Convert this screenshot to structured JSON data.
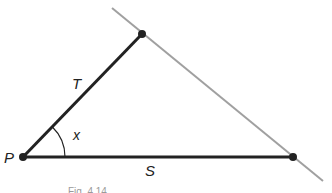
{
  "figure": {
    "caption": "Fig. 4.14",
    "vertices": {
      "P": {
        "x": 23,
        "y": 157
      },
      "top": {
        "x": 142,
        "y": 34
      },
      "right": {
        "x": 293,
        "y": 157
      }
    },
    "segments": {
      "T": {
        "label": "T",
        "from": "P",
        "to": "top",
        "color": "#222222"
      },
      "S": {
        "label": "S",
        "from": "P",
        "to": "right",
        "color": "#222222"
      },
      "extended_line": {
        "from": {
          "x": 112,
          "y": 8
        },
        "to": {
          "x": 323,
          "y": 181
        },
        "color": "#a0a0a0"
      }
    },
    "angle": {
      "label": "x",
      "vertex": "P",
      "radius": 42
    },
    "point_label": "P"
  }
}
